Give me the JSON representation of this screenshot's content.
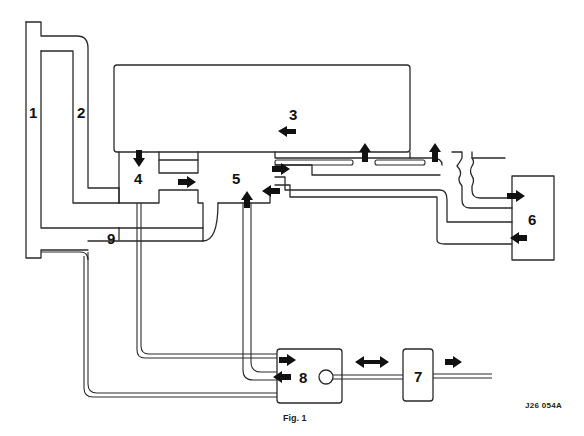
{
  "diagram": {
    "labels": {
      "l1": "1",
      "l2": "2",
      "l3": "3",
      "l4": "4",
      "l5": "5",
      "l6": "6",
      "l7": "7",
      "l8": "8",
      "l9": "9"
    },
    "reference_code": "J26 054A",
    "caption": "Fig. 1",
    "arrows": [
      {
        "id": "a3",
        "direction": "left",
        "near": "3"
      },
      {
        "id": "a4-down",
        "direction": "down",
        "near": "4"
      },
      {
        "id": "a4-5",
        "direction": "right",
        "near": "4-5"
      },
      {
        "id": "a5-up",
        "direction": "up",
        "near": "5"
      },
      {
        "id": "a5-right",
        "direction": "right",
        "near": "5"
      },
      {
        "id": "a5-left",
        "direction": "left",
        "near": "5"
      },
      {
        "id": "a-up-1",
        "direction": "up",
        "near": "3 outlet"
      },
      {
        "id": "a-up-2",
        "direction": "up",
        "near": "3 outlet"
      },
      {
        "id": "a6-in",
        "direction": "right",
        "near": "6"
      },
      {
        "id": "a6-out",
        "direction": "left",
        "near": "6"
      },
      {
        "id": "a8-in",
        "direction": "right",
        "near": "8"
      },
      {
        "id": "a8-out",
        "direction": "left",
        "near": "8"
      },
      {
        "id": "a8-7",
        "direction": "both",
        "near": "8-7"
      },
      {
        "id": "a7-out",
        "direction": "right",
        "near": "7"
      }
    ],
    "colors": {
      "line": "#2a2a2a",
      "arrow": "#111111",
      "background": "#ffffff"
    }
  }
}
